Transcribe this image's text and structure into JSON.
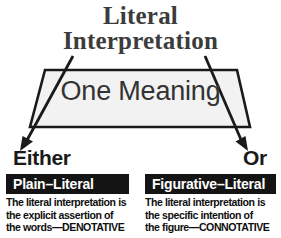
{
  "title": {
    "line1": "Literal",
    "line2": "Interpretation"
  },
  "center": {
    "label": "One Meaning"
  },
  "branches": {
    "left_label": "Either",
    "right_label": "Or"
  },
  "boxes": [
    {
      "header": "Plain–Literal",
      "body_lines": [
        "The literal interpretation is",
        "the explicit assertion of",
        "the words—DENOTATIVE"
      ]
    },
    {
      "header": "Figurative–Literal",
      "body_lines": [
        "The literal interpretation is",
        "the specific intention of",
        "the figure—CONNOTATIVE"
      ]
    }
  ],
  "colors": {
    "title_text": "#3c3c3c",
    "trapezoid_fill": "#f2f2f2",
    "trapezoid_stroke": "#1a1a1a",
    "arrow_stroke": "#1a1a1a",
    "header_bar_bg": "#141414",
    "header_bar_text": "#ffffff",
    "body_text": "#0f0f0f",
    "background": "#ffffff"
  }
}
